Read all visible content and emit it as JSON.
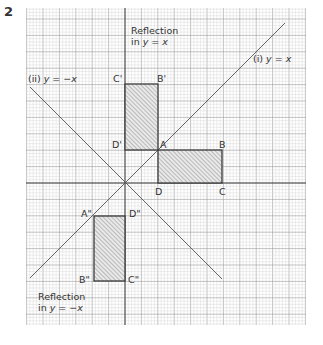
{
  "question_number": "2",
  "grid": {
    "origin_px": [
      125,
      183
    ],
    "unit_px": 16.4,
    "x_range": [
      -6,
      11
    ],
    "y_range": [
      -8.7,
      10.7
    ],
    "minor_divisions": 5,
    "major_color": "#9a9a9a",
    "minor_color": "#d2d2d2"
  },
  "lines": [
    {
      "id": "line_i",
      "label": "(i) y = x",
      "label_prefix": "(i) ",
      "label_eq": "y = x",
      "slope": 1
    },
    {
      "id": "line_ii",
      "label": "(ii) y = −x",
      "label_prefix": "(ii) ",
      "label_eq": "y = −x",
      "slope": -1
    }
  ],
  "shapes": {
    "original": {
      "vertices": {
        "A": [
          2,
          2
        ],
        "B": [
          6,
          2
        ],
        "C": [
          6,
          0
        ],
        "D": [
          2,
          0
        ]
      },
      "labels": {
        "A": "A",
        "B": "B",
        "C": "C",
        "D": "D"
      }
    },
    "reflection_y_eq_x": {
      "vertices": {
        "A'": [
          2,
          2
        ],
        "B'": [
          2,
          6
        ],
        "C'": [
          0,
          6
        ],
        "D'": [
          0,
          2
        ]
      },
      "labels": {
        "A": "A'",
        "B": "B'",
        "C": "C'",
        "D": "D'"
      },
      "caption_line1": "Reflection",
      "caption_line2_prefix": "in ",
      "caption_line2_eq": "y = x"
    },
    "reflection_y_eq_neg_x": {
      "vertices": {
        "A\"": [
          -2,
          -2
        ],
        "B\"": [
          -2,
          -6
        ],
        "C\"": [
          0,
          -6
        ],
        "D\"": [
          0,
          -2
        ]
      },
      "labels": {
        "A": "A\"",
        "B": "B\"",
        "C": "C\"",
        "D": "D\""
      },
      "caption_line1": "Reflection",
      "caption_line2_prefix": "in ",
      "caption_line2_eq": "y = −x"
    }
  },
  "colors": {
    "axis": "#444444",
    "shape_stroke": "#3a3a3a",
    "hatch": "#8a8a8a",
    "fill": "#e8e8e8",
    "text": "#333333"
  }
}
